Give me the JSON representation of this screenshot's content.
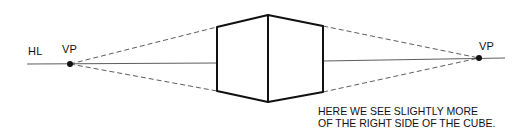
{
  "diagram": {
    "type": "two-point-perspective",
    "labels": {
      "horizon_line": "HL",
      "left_vanishing_point": "VP",
      "right_vanishing_point": "VP"
    },
    "caption": {
      "line1": "HERE WE SEE SLIGHTLY MORE",
      "line2": "OF THE RIGHT SIDE OF THE CUBE."
    },
    "colors": {
      "stroke": "#111111",
      "background": "#ffffff"
    }
  }
}
